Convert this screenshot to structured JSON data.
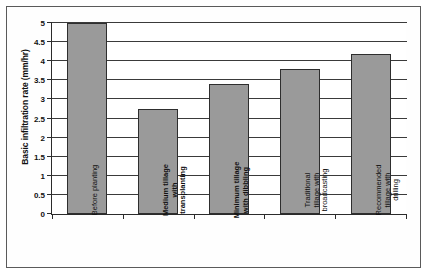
{
  "chart_data": {
    "type": "bar",
    "title": "",
    "xlabel": "",
    "ylabel": "Basic infiltration rate (mm/hr)",
    "ylim": [
      0,
      5
    ],
    "ytick_step": 0.5,
    "yticks": [
      "0",
      "0.5",
      "1",
      "1.5",
      "2",
      "2.5",
      "3",
      "3.5",
      "4",
      "4.5",
      "5"
    ],
    "grid": true,
    "legend": "none",
    "categories": [
      "Before planting",
      "Medium tillage\nwith\ntransplanting",
      "Minimum tillage\nwith dibbling",
      "Traditional\ntillage with\nbroadcasting",
      "Recommended\ntillage with\ndrilling"
    ],
    "values": [
      5,
      2.75,
      3.4,
      3.8,
      4.2
    ],
    "bar_label_bold": [
      false,
      true,
      true,
      false,
      false
    ],
    "colors": {
      "bar_fill": "#9a9a9a",
      "bar_border": "#2e2e2e",
      "axis": "#2b2b2b",
      "gridline": "#3a3a3a",
      "frame": "#5a5a5a",
      "text": "#111111"
    }
  }
}
